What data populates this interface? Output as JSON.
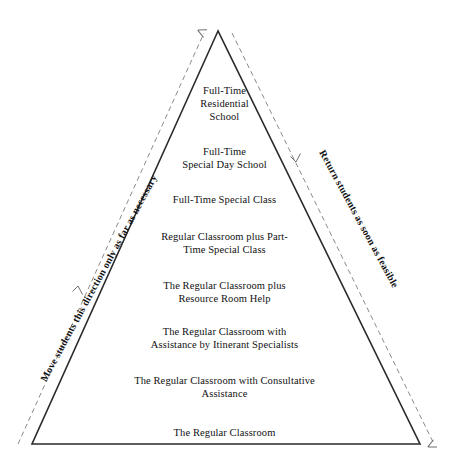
{
  "diagram": {
    "shape": "triangle",
    "colors": {
      "background": "#ffffff",
      "solid_line": "#2b2b2b",
      "dashed_line": "#8a8a8a",
      "text": "#111111"
    },
    "geometry": {
      "apex": [
        218,
        31
      ],
      "bottom_left": [
        32,
        444
      ],
      "bottom_right": [
        420,
        444
      ]
    },
    "tiers": [
      {
        "id": "tier-1",
        "text": "Full-Time\nResidential\nSchool",
        "y": 84
      },
      {
        "id": "tier-2",
        "text": "Full-Time\nSpecial Day School",
        "y": 145
      },
      {
        "id": "tier-3",
        "text": "Full-Time Special Class",
        "y": 193
      },
      {
        "id": "tier-4",
        "text": "Regular Classroom plus Part-\nTime Special Class",
        "y": 230
      },
      {
        "id": "tier-5",
        "text": "The Regular Classroom plus\nResource Room Help",
        "y": 279
      },
      {
        "id": "tier-6",
        "text": "The Regular Classroom with\nAssistance by Itinerant Specialists",
        "y": 325
      },
      {
        "id": "tier-7",
        "text": "The Regular Classroom with Consultative\nAssistance",
        "y": 374
      },
      {
        "id": "tier-8",
        "text": "The Regular Classroom",
        "y": 426
      }
    ],
    "annotations": {
      "left": "Move students this direction only as far as necessary",
      "right": "Return students as soon as feasible"
    },
    "arrows": {
      "left_direction": "up",
      "right_direction": "down"
    }
  }
}
